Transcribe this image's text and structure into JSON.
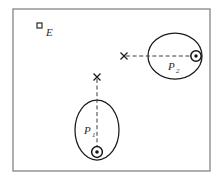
{
  "figure": {
    "kind": "orbital-diagram",
    "background_color": "#ffffff",
    "frame": {
      "stroke_color": "#8d8d8d",
      "x": 13,
      "y": 9,
      "width": 197,
      "height": 162
    },
    "stroke_color": "#1b1b1b",
    "dash_color": "#3a3a3a",
    "markers": [
      {
        "id": "observer",
        "label": "E",
        "shape": "square",
        "x": 37,
        "y": 23,
        "size": 5,
        "label_x": 46,
        "label_y": 36
      }
    ],
    "orbits": [
      {
        "id": "orbit-p2",
        "label": "P",
        "subscript": "2",
        "orientation": "horizontal",
        "center_x": 175,
        "center_y": 56,
        "radius_x": 27,
        "radius_y": 23,
        "label_x": 168,
        "label_y": 70,
        "subscript_x": 176,
        "subscript_y": 73,
        "axis": {
          "x1": 126,
          "y1": 56,
          "x2": 197,
          "y2": 56
        },
        "focus_cross": {
          "x": 124,
          "y": 56,
          "arm": 3.5
        },
        "body": {
          "x": 196,
          "y": 56,
          "outer_r": 5.2,
          "dot_r": 1.7
        }
      },
      {
        "id": "orbit-p1",
        "label": "P",
        "subscript": "1",
        "orientation": "vertical",
        "center_x": 97,
        "center_y": 130,
        "radius_x": 22,
        "radius_y": 30,
        "label_x": 84,
        "label_y": 134,
        "subscript_x": 92,
        "subscript_y": 137,
        "axis": {
          "x1": 97,
          "y1": 79,
          "x2": 97,
          "y2": 153
        },
        "focus_cross": {
          "x": 97,
          "y": 77,
          "arm": 3.5
        },
        "body": {
          "x": 97,
          "y": 152,
          "outer_r": 5.4,
          "dot_r": 1.8
        }
      }
    ]
  }
}
